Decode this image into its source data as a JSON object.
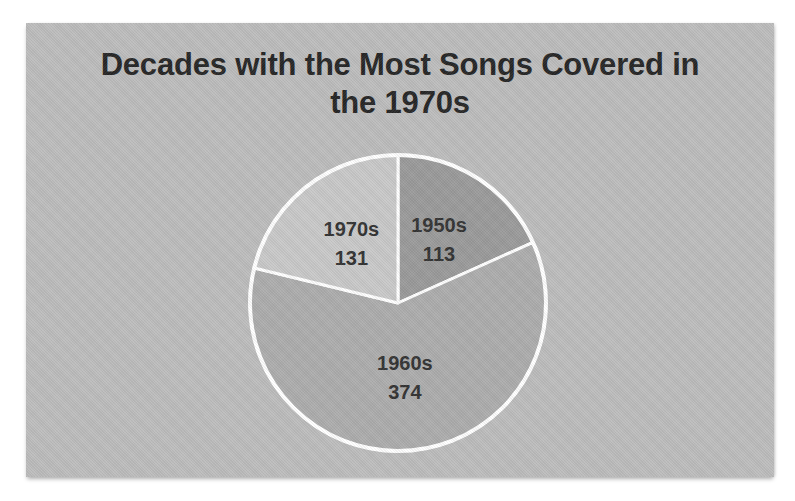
{
  "window": {
    "width_px": 795,
    "height_px": 501,
    "page_background": "#ffffff"
  },
  "panel": {
    "background_color": "#bdbdbd",
    "description": "scanned gray chart panel"
  },
  "title": {
    "line1": "Decades with the Most Songs Covered in",
    "line2": "the 1970s",
    "color": "#262626"
  },
  "chart_data": {
    "type": "pie",
    "title": "Decades with the Most Songs Covered in the 1970s",
    "categories": [
      "1950s",
      "1960s",
      "1970s"
    ],
    "values": [
      113,
      374,
      131
    ],
    "total": 618,
    "start_angle_deg": 0,
    "direction": "clockwise",
    "slice_colors": [
      "#9b9b9b",
      "#adadad",
      "#c9c9c9"
    ],
    "outline_color": "#ffffff",
    "label_style": "category-name-and-value-inside-slice",
    "label_color": "#333333",
    "legend": "none",
    "grid": "off"
  }
}
